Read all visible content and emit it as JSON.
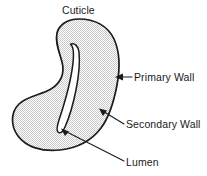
{
  "figure": {
    "type": "labeled-anatomical-diagram",
    "background_color": "#ffffff",
    "outline_color": "#1b1b1b",
    "fill_color": "#d9d9d9",
    "lumen_color": "#ffffff",
    "text_color": "#1a1a1a"
  },
  "labels": {
    "cuticle": "Cuticle",
    "primary_wall": "Primary Wall",
    "secondary_wall": "Secondary Wall",
    "lumen": "Lumen"
  },
  "annotations": [
    {
      "name": "cuticle",
      "text": "Cuticle",
      "position": "top-center",
      "leader": "none"
    },
    {
      "name": "primary-wall",
      "text": "Primary Wall",
      "position": "right-upper",
      "leader": "arrow-left"
    },
    {
      "name": "secondary-wall",
      "text": "Secondary Wall",
      "position": "right-middle",
      "leader": "diagonal-up-left"
    },
    {
      "name": "lumen",
      "text": "Lumen",
      "position": "bottom-right",
      "leader": "diagonal-up-left"
    }
  ]
}
